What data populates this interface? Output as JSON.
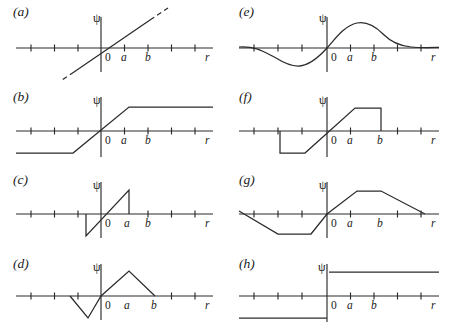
{
  "figure": {
    "axis_labels": {
      "origin": "0",
      "a": "a",
      "b": "b",
      "r": "r",
      "psi": "ψ"
    },
    "panels": [
      {
        "id": "a",
        "label": "(a)",
        "description": "straight line through origin, dashed beyond axis range",
        "shape": "linear-dashed"
      },
      {
        "id": "e",
        "label": "(e)",
        "description": "smooth odd sinusoid-like curve, trough left of origin, crest between a and b",
        "shape": "smooth-odd-wave"
      },
      {
        "id": "b",
        "label": "(b)",
        "description": "saturating ramp, constant negative plateau then rise through origin to constant positive plateau after a",
        "shape": "saturating-ramp"
      },
      {
        "id": "f",
        "label": "(f)",
        "description": "ramp with flat plateaus and vertical drops to zero at both outer ends",
        "shape": "clipped-ramp-truncated"
      },
      {
        "id": "c",
        "label": "(c)",
        "description": "single sawtooth ramp through origin with vertical edges at both ends near a",
        "shape": "sawtooth"
      },
      {
        "id": "g",
        "label": "(g)",
        "description": "trapezoidal wave, negative plateau left, positive plateau between a and b, decaying to zero at right",
        "shape": "trapezoid-wave"
      },
      {
        "id": "d",
        "label": "(d)",
        "description": "triangular wave, negative apex left of origin, positive apex between a and b, zero at b",
        "shape": "triangle-wave"
      },
      {
        "id": "h",
        "label": "(h)",
        "description": "step discontinuity at origin from constant negative to constant positive",
        "shape": "step"
      }
    ]
  }
}
